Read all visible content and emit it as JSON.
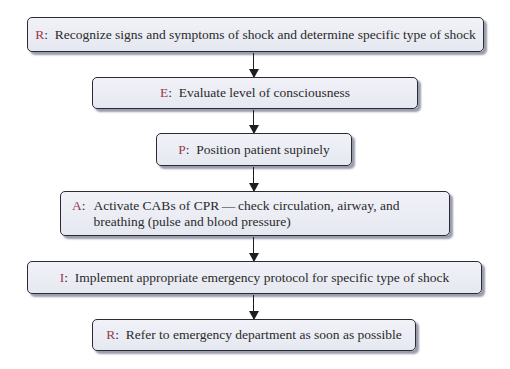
{
  "diagram": {
    "type": "flowchart",
    "acronym": "REPAIR",
    "colors": {
      "letter": "#9a3a4b",
      "box_fill": "#eceef5",
      "box_border": "#2b2b33",
      "text": "#2a2a2a",
      "arrow": "#1e1e1e"
    },
    "steps": [
      {
        "letter": "R",
        "sep": ":",
        "text": "Recognize signs and symptoms of shock and determine specific type of shock"
      },
      {
        "letter": "E",
        "sep": ":",
        "text": "Evaluate level of consciousness"
      },
      {
        "letter": "P",
        "sep": ":",
        "text": "Position patient supinely"
      },
      {
        "letter": "A",
        "sep": ":",
        "text": "Activate CABs of CPR — check circulation, airway, and breathing (pulse and blood pressure)"
      },
      {
        "letter": "I",
        "sep": ":",
        "text": "Implement appropriate emergency protocol for specific type of shock"
      },
      {
        "letter": "R",
        "sep": ":",
        "text": "Refer to emergency department as soon as possible"
      }
    ],
    "connectors": [
      {
        "from": 0,
        "to": 1
      },
      {
        "from": 1,
        "to": 2
      },
      {
        "from": 2,
        "to": 3
      },
      {
        "from": 3,
        "to": 4
      },
      {
        "from": 4,
        "to": 5
      }
    ]
  }
}
